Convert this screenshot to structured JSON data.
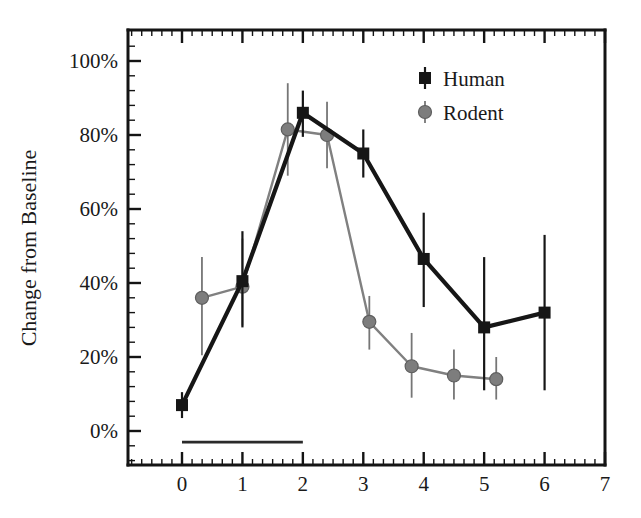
{
  "chart_data": {
    "type": "line",
    "title": "",
    "subtitle": "",
    "xlabel": "",
    "ylabel": "Change from Baseline",
    "xlim": [
      -0.45,
      7.0
    ],
    "ylim": [
      -8,
      106
    ],
    "grid": false,
    "legend_position": "top-right",
    "x_ticks": [
      "0",
      "1",
      "2",
      "3",
      "4",
      "5",
      "6",
      "7"
    ],
    "x_tick_values": [
      0,
      1,
      2,
      3,
      4,
      5,
      6,
      7
    ],
    "x_minor_ticks_per_interval": 5,
    "y_ticks": [
      "0%",
      "20%",
      "40%",
      "60%",
      "80%",
      "100%"
    ],
    "y_tick_values": [
      0,
      20,
      40,
      60,
      80,
      100
    ],
    "y_minor_ticks_per_interval": 4,
    "annotations": [
      {
        "name": "treatment-bar",
        "type": "horizontal-bar",
        "x_start": 0,
        "x_end": 2,
        "y": -3,
        "label": ""
      }
    ],
    "series": [
      {
        "name": "Human",
        "marker": "square",
        "color": "#161616",
        "x": [
          0,
          1,
          2,
          3,
          4,
          5,
          6
        ],
        "values": [
          7,
          40.5,
          86,
          75,
          46.5,
          28,
          32
        ],
        "error_low": [
          3.5,
          28,
          79.5,
          68.5,
          33.5,
          11,
          11
        ],
        "error_high": [
          10.5,
          54,
          92,
          81.5,
          59,
          47,
          53
        ]
      },
      {
        "name": "Rodent",
        "marker": "circle",
        "color": "#7d7d7d",
        "x": [
          0.33,
          1.0,
          1.75,
          2.4,
          3.1,
          3.8,
          4.5,
          5.2
        ],
        "values": [
          36,
          39,
          81.5,
          80,
          29.5,
          17.5,
          15,
          14
        ],
        "error_low": [
          20.5,
          28.5,
          69,
          71,
          22,
          9,
          8.5,
          8.5
        ],
        "error_high": [
          47,
          52,
          94,
          89,
          36.5,
          26.5,
          22,
          20
        ]
      }
    ]
  },
  "legend": {
    "entries": [
      {
        "label": "Human",
        "marker": "square",
        "color": "#161616"
      },
      {
        "label": "Rodent",
        "marker": "circle",
        "color": "#7d7d7d"
      }
    ]
  },
  "axes": {
    "y_title": "Change from Baseline"
  }
}
